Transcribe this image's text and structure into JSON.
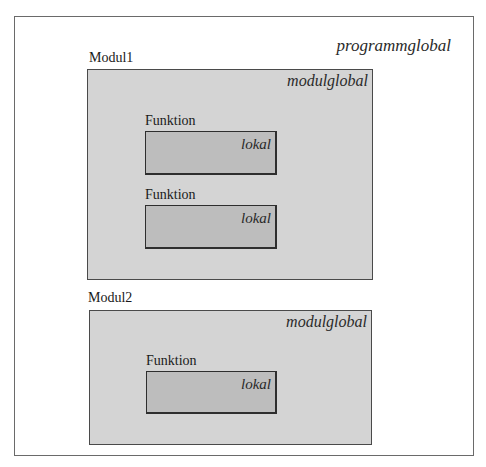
{
  "diagram": {
    "program": {
      "scope_label": "programmglobal",
      "border_color": "#6a6a6a",
      "fill": "#ffffff"
    },
    "modules": [
      {
        "name": "Modul1",
        "scope_label": "modulglobal",
        "fill": "#d4d4d4",
        "functions": [
          {
            "name": "Funktion",
            "scope_label": "lokal"
          },
          {
            "name": "Funktion",
            "scope_label": "lokal"
          }
        ]
      },
      {
        "name": "Modul2",
        "scope_label": "modulglobal",
        "fill": "#d4d4d4",
        "functions": [
          {
            "name": "Funktion",
            "scope_label": "lokal"
          }
        ]
      }
    ],
    "function_fill": "#bdbdbd"
  }
}
